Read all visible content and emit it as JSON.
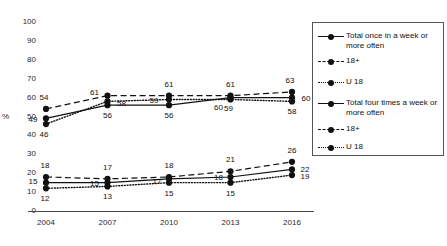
{
  "chart_data": {
    "type": "line",
    "title": "",
    "subtitle": "",
    "xlabel": "",
    "ylabel": "%",
    "categories": [
      "2004",
      "2007",
      "2010",
      "2013",
      "2016"
    ],
    "x": [
      2004,
      2007,
      2010,
      2013,
      2016
    ],
    "ylim": [
      0,
      100
    ],
    "ytick_step": 10,
    "yticks": [
      "100",
      "90",
      "80",
      "70",
      "60",
      "50",
      "40",
      "30",
      "20",
      "10",
      "0"
    ],
    "grid": false,
    "legend_position": "right",
    "series": [
      {
        "name": "Total once in a week or more often",
        "group": "once a week or more often",
        "style": "solid",
        "values": [
          49,
          56,
          56,
          60,
          60
        ],
        "labels": [
          "49",
          "56",
          "56",
          "60",
          "60"
        ]
      },
      {
        "name": "18+",
        "group": "once a week or more often",
        "style": "dashed",
        "values": [
          54,
          61,
          61,
          61,
          63
        ],
        "labels": [
          "54",
          "61",
          "61",
          "61",
          "63"
        ]
      },
      {
        "name": "U 18",
        "group": "once a week or more often",
        "style": "dotted",
        "values": [
          46,
          58,
          59,
          59,
          58
        ],
        "labels": [
          "46",
          "58",
          "59",
          "59",
          "58"
        ]
      },
      {
        "name": "Total four times a week or more often",
        "group": "four times a week or more often",
        "style": "solid",
        "values": [
          15,
          15,
          17,
          18,
          22
        ],
        "labels": [
          "15",
          "15",
          "17",
          "18",
          "22"
        ]
      },
      {
        "name": "18+",
        "group": "four times a week or more often",
        "style": "dashed",
        "values": [
          18,
          17,
          18,
          21,
          26
        ],
        "labels": [
          "18",
          "17",
          "18",
          "21",
          "26"
        ]
      },
      {
        "name": "U 18",
        "group": "four times a week or more often",
        "style": "dotted",
        "values": [
          12,
          13,
          15,
          15,
          19
        ],
        "labels": [
          "12",
          "13",
          "15",
          "15",
          "19"
        ]
      }
    ],
    "colors": {
      "line": "#111111",
      "marker": "#111111",
      "axis": "#4a4a4a",
      "text": "#1a1a1a",
      "background": "#ffffff"
    }
  },
  "legend": {
    "items": [
      {
        "label": "Total once in a week or more often",
        "style": "solid"
      },
      {
        "label": "18+",
        "style": "dashed"
      },
      {
        "label": "U 18",
        "style": "dotted"
      },
      {
        "label": "Total four times a week or more often",
        "style": "solid"
      },
      {
        "label": "18+",
        "style": "dashed"
      },
      {
        "label": "U 18",
        "style": "dotted"
      }
    ]
  }
}
